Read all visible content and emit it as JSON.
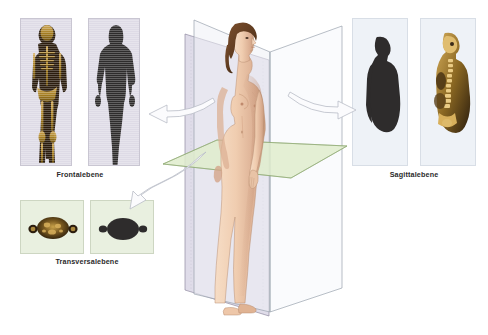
{
  "diagram": {
    "background_color": "#ffffff",
    "label_color": "#2b2b2b"
  },
  "labels": {
    "frontal": "Frontalebene",
    "transversal": "Transversalebene",
    "sagittal": "Sagittalebene"
  },
  "planes": {
    "frontal": {
      "name": "Frontalebene",
      "color": "#d8d4e4",
      "edge_color": "#8f8aa0",
      "orientation": "vertical-coronal"
    },
    "sagittal": {
      "name": "Sagittalebene",
      "color": "#eef1f6",
      "edge_color": "#9aa2ae",
      "orientation": "vertical-median"
    },
    "transversal": {
      "name": "Transversalebene",
      "color": "#dfeccd",
      "edge_color": "#7d9a63",
      "orientation": "horizontal-axial"
    }
  },
  "panels": {
    "frontal_scan": {
      "name": "Frontalschnitt Ganzkoerper",
      "background": "#dedbe6",
      "subject_color": "#3a2a18",
      "accent_color": "#c9a24a"
    },
    "frontal_silhouette": {
      "name": "Frontalsilhouette",
      "background": "#dedbe6",
      "subject_color": "#2e2c2c"
    },
    "transversal_scan": {
      "name": "Transversalschnitt Becken",
      "background": "#e9f0e0",
      "subject_color": "#3a2a18",
      "accent_color": "#c9a24a"
    },
    "transversal_silhouette": {
      "name": "Transversalsilhouette",
      "background": "#e9f0e0",
      "subject_color": "#2e2c2c"
    },
    "sagittal_silhouette": {
      "name": "Sagittalsilhouette Profil",
      "background": "#eef2f7",
      "subject_color": "#2e2c2c"
    },
    "sagittal_scan": {
      "name": "Sagittalschnitt Rumpf",
      "background": "#eef2f7",
      "subject_color": "#3a2a18",
      "accent_color": "#c9a24a"
    }
  },
  "arrows": [
    {
      "name": "arrow-to-frontal",
      "direction": "left",
      "from": "Frontalebene",
      "to": "Frontalschnitt"
    },
    {
      "name": "arrow-to-sagittal",
      "direction": "right",
      "from": "Sagittalebene",
      "to": "Sagittalschnitt"
    },
    {
      "name": "arrow-to-transversal",
      "direction": "down-left",
      "from": "Transversalebene",
      "to": "Transversalschnitt"
    }
  ],
  "figure": {
    "name": "weibliche Koerperfigur",
    "skin_color": "#f0cdb0",
    "hair_color": "#6b4326",
    "pose": "stehend, Profil nach rechts"
  }
}
